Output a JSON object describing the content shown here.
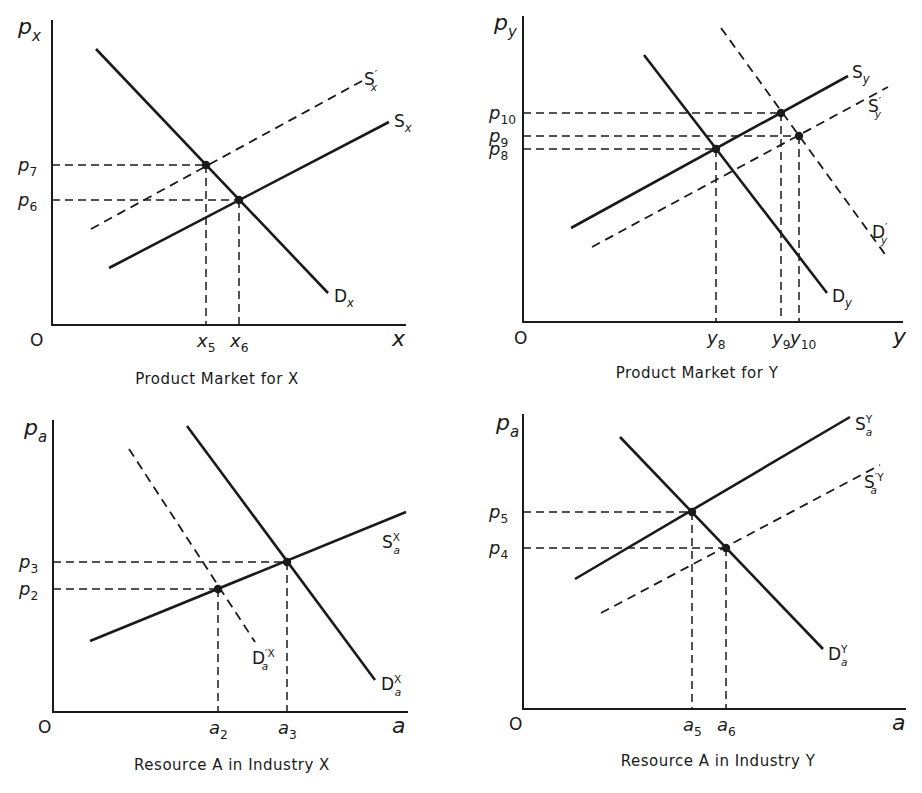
{
  "figure": {
    "panels": [
      {
        "id": "product-market-x",
        "caption": "Product Market for X",
        "origin_label": "O",
        "y_axis_label": {
          "main": "p",
          "sub": "x"
        },
        "x_axis_label": "x",
        "axes": {
          "x0": 52,
          "y0": 325,
          "ytop": 20,
          "xright": 406
        },
        "caption_pos": [
          217,
          384
        ],
        "origin_pos": [
          30,
          346
        ],
        "ylabel_pos": [
          18,
          34
        ],
        "xlabel_pos": [
          392,
          346
        ],
        "curves": [
          {
            "name": "demand-x",
            "style": "solid",
            "from": [
              96,
              49
            ],
            "to": [
              328,
              293
            ],
            "label": {
              "main": "D",
              "sub": "x",
              "sup": ""
            },
            "label_pos": [
              334,
              302
            ]
          },
          {
            "name": "supply-x",
            "style": "solid",
            "from": [
              109,
              268
            ],
            "to": [
              389,
              122
            ],
            "label": {
              "main": "S",
              "sub": "x",
              "sup": ""
            },
            "label_pos": [
              394,
              127
            ]
          },
          {
            "name": "supply-x-shifted",
            "style": "dashed",
            "from": [
              91,
              229
            ],
            "to": [
              362,
              81
            ],
            "label": {
              "main": "S",
              "sub": "x",
              "sup": "′"
            },
            "label_pos": [
              364,
              85
            ]
          }
        ],
        "equilibria": [
          {
            "name": "p7-x5",
            "point": [
              206,
              165
            ],
            "price_label": {
              "main": "p",
              "sub": "7"
            },
            "qty_label": {
              "main": "x",
              "sub": "5"
            }
          },
          {
            "name": "p6-x6",
            "point": [
              239,
              200
            ],
            "price_label": {
              "main": "p",
              "sub": "6"
            },
            "qty_label": {
              "main": "x",
              "sub": "6"
            }
          }
        ]
      },
      {
        "id": "product-market-y",
        "caption": "Product Market for Y",
        "origin_label": "O",
        "y_axis_label": {
          "main": "p",
          "sub": "y"
        },
        "x_axis_label": "y",
        "axes": {
          "x0": 523,
          "y0": 322,
          "ytop": 16,
          "xright": 903
        },
        "caption_pos": [
          697,
          378
        ],
        "origin_pos": [
          514,
          344
        ],
        "ylabel_pos": [
          494,
          30
        ],
        "xlabel_pos": [
          893,
          344
        ],
        "curves": [
          {
            "name": "demand-y",
            "style": "solid",
            "from": [
              644,
              55
            ],
            "to": [
              827,
              293
            ],
            "label": {
              "main": "D",
              "sub": "y",
              "sup": ""
            },
            "label_pos": [
              832,
              302
            ]
          },
          {
            "name": "supply-y",
            "style": "solid",
            "from": [
              571,
              228
            ],
            "to": [
              848,
              76
            ],
            "label": {
              "main": "S",
              "sub": "y",
              "sup": ""
            },
            "label_pos": [
              852,
              78
            ]
          },
          {
            "name": "supply-y-shifted",
            "style": "dashed",
            "from": [
              592,
              247
            ],
            "to": [
              888,
              87
            ],
            "label": {
              "main": "S",
              "sub": "y",
              "sup": "′"
            },
            "label_pos": [
              868,
              112
            ]
          },
          {
            "name": "demand-y-shifted",
            "style": "dashed",
            "from": [
              721,
              28
            ],
            "to": [
              887,
              257
            ],
            "label": {
              "main": "D",
              "sub": "y",
              "sup": "′"
            },
            "label_pos": [
              872,
              238
            ]
          }
        ],
        "equilibria": [
          {
            "name": "p10-y9",
            "point": [
              781,
              113
            ],
            "price_label": {
              "main": "p",
              "sub": "10"
            },
            "qty_label": {
              "main": "y",
              "sub": "9"
            }
          },
          {
            "name": "p9-y10",
            "point": [
              799,
              136
            ],
            "price_label": {
              "main": "p",
              "sub": "9"
            },
            "qty_label": {
              "main": "y",
              "sub": "10"
            }
          },
          {
            "name": "p8-y8",
            "point": [
              716,
              149
            ],
            "price_label": {
              "main": "p",
              "sub": "8"
            },
            "qty_label": {
              "main": "y",
              "sub": "8"
            }
          }
        ]
      },
      {
        "id": "resource-a-industry-x",
        "caption": "Resource A in Industry X",
        "origin_label": "O",
        "y_axis_label": {
          "main": "p",
          "sub": "a"
        },
        "x_axis_label": "a",
        "axes": {
          "x0": 53,
          "y0": 712,
          "ytop": 420,
          "xright": 408
        },
        "caption_pos": [
          232,
          770
        ],
        "origin_pos": [
          38,
          733
        ],
        "ylabel_pos": [
          24,
          435
        ],
        "xlabel_pos": [
          392,
          733
        ],
        "curves": [
          {
            "name": "demand-a-x",
            "style": "solid",
            "from": [
              187,
              426
            ],
            "to": [
              375,
              680
            ],
            "label": {
              "main": "D",
              "sub": "a",
              "sup": "X"
            },
            "label_pos": [
              381,
              690
            ]
          },
          {
            "name": "supply-a-x",
            "style": "solid",
            "from": [
              90,
              641
            ],
            "to": [
              406,
              512
            ],
            "label": {
              "main": "S",
              "sub": "a",
              "sup": "X"
            },
            "label_pos": [
              382,
              548
            ]
          },
          {
            "name": "demand-a-x-shifted",
            "style": "dashed",
            "from": [
              129,
              449
            ],
            "to": [
              255,
              642
            ],
            "label": {
              "main": "D",
              "sub": "a",
              "sup": "′X"
            },
            "label_pos": [
              252,
              664
            ]
          }
        ],
        "equilibria": [
          {
            "name": "p3-a3",
            "point": [
              287,
              562
            ],
            "price_label": {
              "main": "p",
              "sub": "3"
            },
            "qty_label": {
              "main": "a",
              "sub": "3"
            }
          },
          {
            "name": "p2-a2",
            "point": [
              218,
              589
            ],
            "price_label": {
              "main": "p",
              "sub": "2"
            },
            "qty_label": {
              "main": "a",
              "sub": "2"
            }
          }
        ]
      },
      {
        "id": "resource-a-industry-y",
        "caption": "Resource A in Industry Y",
        "origin_label": "O",
        "y_axis_label": {
          "main": "p",
          "sub": "a"
        },
        "x_axis_label": "a",
        "axes": {
          "x0": 523,
          "y0": 709,
          "ytop": 414,
          "xright": 906
        },
        "caption_pos": [
          718,
          766
        ],
        "origin_pos": [
          509,
          730
        ],
        "ylabel_pos": [
          496,
          430
        ],
        "xlabel_pos": [
          892,
          730
        ],
        "curves": [
          {
            "name": "demand-a-y",
            "style": "solid",
            "from": [
              620,
              437
            ],
            "to": [
              823,
              649
            ],
            "label": {
              "main": "D",
              "sub": "a",
              "sup": "Y"
            },
            "label_pos": [
              828,
              660
            ]
          },
          {
            "name": "supply-a-y",
            "style": "solid",
            "from": [
              575,
              579
            ],
            "to": [
              850,
              417
            ],
            "label": {
              "main": "S",
              "sub": "a",
              "sup": "Y"
            },
            "label_pos": [
              855,
              430
            ]
          },
          {
            "name": "supply-a-y-shifted",
            "style": "dashed",
            "from": [
              601,
              613
            ],
            "to": [
              880,
              465
            ],
            "label": {
              "main": "S",
              "sub": "a",
              "sup": "′Y"
            },
            "label_pos": [
              864,
              488
            ]
          }
        ],
        "equilibria": [
          {
            "name": "p5-a5",
            "point": [
              692,
              512
            ],
            "price_label": {
              "main": "p",
              "sub": "5"
            },
            "qty_label": {
              "main": "a",
              "sub": "5"
            }
          },
          {
            "name": "p4-a6",
            "point": [
              726,
              548
            ],
            "price_label": {
              "main": "p",
              "sub": "4"
            },
            "qty_label": {
              "main": "a",
              "sub": "6"
            }
          }
        ]
      }
    ]
  }
}
